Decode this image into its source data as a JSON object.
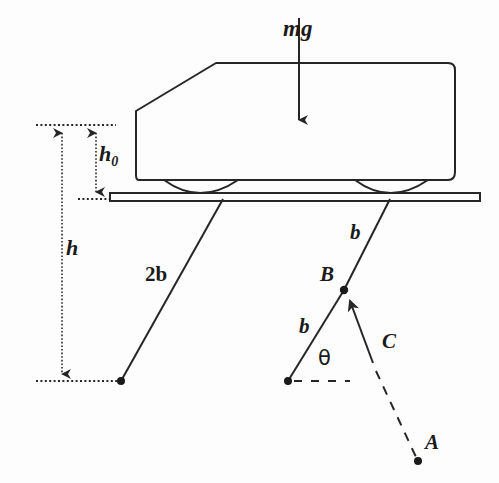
{
  "figure": {
    "stroke_color": "#262626",
    "background_color": "#fdfdfd",
    "labels": {
      "load_force": "mg",
      "height_small": "h",
      "height_small_sub": "0",
      "height_total": "h",
      "link_long": "2b",
      "link_upper_right": "b",
      "link_lower_right": "b",
      "angle": "θ",
      "point_a": "A",
      "point_b": "B",
      "point_c": "C"
    },
    "icons": {
      "load_arrow": "down-arrow-icon",
      "h0_arrow": "double-headed-vertical-arrow-icon",
      "h_arrow": "down-arrow-icon",
      "c_arrow": "up-left-arrow-icon",
      "pivot": "pivot-dot-icon"
    },
    "geometry": {
      "car_body_points": "136,111 216,63 448,63 455,70 455,172 448,180 139,180 136,175",
      "platform": {
        "x": 110,
        "y": 193,
        "width": 370,
        "height": 8
      },
      "wheel_front": {
        "cx": 200,
        "cy": 180,
        "rx": 42,
        "ry": 18
      },
      "wheel_rear": {
        "cx": 390,
        "cy": 180,
        "rx": 42,
        "ry": 18
      },
      "mg_arrow": {
        "x": 299,
        "y1": 18,
        "y2": 127
      },
      "h0_top_y": 125,
      "h0_bottom_y": 199,
      "h_top_y": 125,
      "h_bottom_y": 381,
      "h0_axis_x": 96,
      "h_axis_x": 62,
      "link_long": {
        "x1": 121,
        "y1": 381,
        "x2": 223,
        "y2": 199
      },
      "link_upper_right": {
        "x1": 344,
        "y1": 290,
        "x2": 390,
        "y2": 199
      },
      "link_lower_right": {
        "x1": 288,
        "y1": 381,
        "x2": 344,
        "y2": 290
      },
      "c_arrow": {
        "x1": 373,
        "y1": 363,
        "x2": 346,
        "y2": 293
      },
      "dashed_to_a": {
        "x1": 376,
        "y1": 371,
        "x2": 418,
        "y2": 461
      },
      "theta_ref_dash": {
        "x1": 293,
        "y1": 381,
        "x2": 350,
        "y2": 381
      }
    }
  }
}
